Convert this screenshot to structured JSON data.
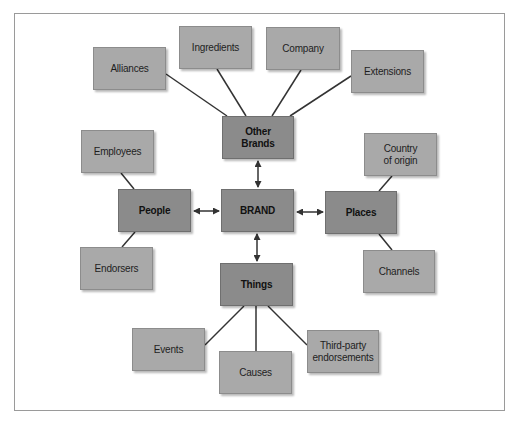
{
  "diagram": {
    "type": "brand-knowledge-map",
    "colors": {
      "frame_border": "#9a9a9a",
      "outer_node_fill": "#a9a9a9",
      "inner_node_fill": "#8b8b8b",
      "connector": "#333333",
      "background": "#ffffff"
    },
    "center": {
      "label": "BRAND"
    },
    "primary_nodes": {
      "other_brands": {
        "label": "Other\nBrands"
      },
      "people": {
        "label": "People"
      },
      "places": {
        "label": "Places"
      },
      "things": {
        "label": "Things"
      }
    },
    "secondary_nodes": {
      "alliances": {
        "label": "Alliances",
        "parent": "Other Brands"
      },
      "ingredients": {
        "label": "Ingredients",
        "parent": "Other Brands"
      },
      "company": {
        "label": "Company",
        "parent": "Other Brands"
      },
      "extensions": {
        "label": "Extensions",
        "parent": "Other Brands"
      },
      "employees": {
        "label": "Employees",
        "parent": "People"
      },
      "endorsers": {
        "label": "Endorsers",
        "parent": "People"
      },
      "country_of_origin": {
        "label": "Country\nof origin",
        "parent": "Places"
      },
      "channels": {
        "label": "Channels",
        "parent": "Places"
      },
      "events": {
        "label": "Events",
        "parent": "Things"
      },
      "causes": {
        "label": "Causes",
        "parent": "Things"
      },
      "third_party_endorsements": {
        "label": "Third-party\nendorsements",
        "parent": "Things"
      }
    },
    "edges": [
      {
        "from": "BRAND",
        "to": "Other Brands",
        "style": "double-arrow"
      },
      {
        "from": "BRAND",
        "to": "People",
        "style": "double-arrow"
      },
      {
        "from": "BRAND",
        "to": "Places",
        "style": "double-arrow"
      },
      {
        "from": "BRAND",
        "to": "Things",
        "style": "double-arrow"
      },
      {
        "from": "Other Brands",
        "to": "Alliances",
        "style": "line"
      },
      {
        "from": "Other Brands",
        "to": "Ingredients",
        "style": "line"
      },
      {
        "from": "Other Brands",
        "to": "Company",
        "style": "line"
      },
      {
        "from": "Other Brands",
        "to": "Extensions",
        "style": "line"
      },
      {
        "from": "People",
        "to": "Employees",
        "style": "line"
      },
      {
        "from": "People",
        "to": "Endorsers",
        "style": "line"
      },
      {
        "from": "Places",
        "to": "Country of origin",
        "style": "line"
      },
      {
        "from": "Places",
        "to": "Channels",
        "style": "line"
      },
      {
        "from": "Things",
        "to": "Events",
        "style": "line"
      },
      {
        "from": "Things",
        "to": "Causes",
        "style": "line"
      },
      {
        "from": "Things",
        "to": "Third-party endorsements",
        "style": "line"
      }
    ]
  }
}
